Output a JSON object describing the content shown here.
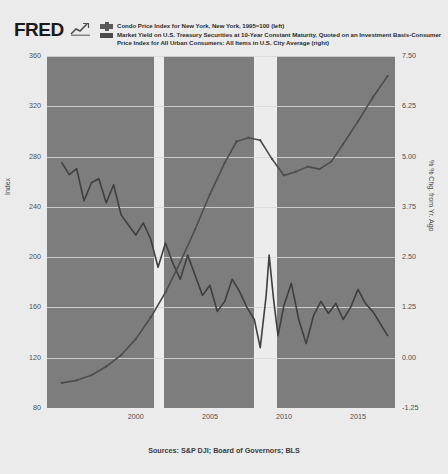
{
  "header": {
    "logo_text": "FRED",
    "logo_icon": "chart-swoosh-icon"
  },
  "legend": {
    "series": [
      {
        "marker": "cross-line-marker",
        "label": "Condo Price Index for New York, New York, 1995=100 (left)",
        "color": "#5a5a5a",
        "axis": "left"
      },
      {
        "marker": "solid-line-marker",
        "label": "Market Yield on U.S. Treasury Securities at 10-Year Constant Maturity, Quoted on an Investment Basis-Consumer Price Index for All Urban Consumers: All Items in U.S. City Average (right)",
        "color": "#4a4a4a",
        "axis": "right"
      }
    ]
  },
  "source": "Sources: S&P DJI; Board of Governors; BLS",
  "chart_data": {
    "type": "line",
    "title": "",
    "xlabel": "",
    "ylabel": "Index",
    "y2label": "% % Chg. from Yr. Ago",
    "grid": true,
    "legend_position": "top",
    "plot_background": "#7d7d7d",
    "gridline_color": "#d8d8d8",
    "page_background": "#ececec",
    "xlim": [
      1994.0,
      2017.5
    ],
    "xticks": [
      2000,
      2005,
      2010,
      2015
    ],
    "xtick_labels": [
      "2000",
      "2005",
      "2010",
      "2015"
    ],
    "ylim": [
      80,
      360
    ],
    "yticks": [
      80,
      120,
      160,
      200,
      240,
      280,
      320,
      360
    ],
    "ytick_labels": [
      "80",
      "120",
      "160",
      "200",
      "240",
      "280",
      "320",
      "360"
    ],
    "y2lim": [
      -1.25,
      7.5
    ],
    "y2ticks": [
      -1.25,
      0.0,
      1.25,
      2.5,
      3.75,
      5.0,
      6.25,
      7.5
    ],
    "y2tick_labels": [
      "-1.25",
      "0.00",
      "1.25",
      "2.50",
      "3.75",
      "5.00",
      "6.25",
      "7.50"
    ],
    "recession_bands": [
      {
        "start": 2001.2,
        "end": 2001.9
      },
      {
        "start": 2007.95,
        "end": 2009.5
      }
    ],
    "series": [
      {
        "name": "Condo Price Index for New York, New York, 1995=100 (left)",
        "axis": "left",
        "color": "#4d4d4d",
        "width": 1.6,
        "x": [
          1995.0,
          1996.0,
          1997.0,
          1998.0,
          1999.0,
          2000.0,
          2001.0,
          2002.0,
          2003.0,
          2004.0,
          2005.0,
          2006.0,
          2006.8,
          2007.6,
          2008.4,
          2009.2,
          2010.0,
          2010.8,
          2011.6,
          2012.4,
          2013.2,
          2014.0,
          2015.0,
          2016.0,
          2017.0
        ],
        "values": [
          100,
          102,
          106,
          113,
          122,
          135,
          152,
          172,
          196,
          222,
          250,
          275,
          292,
          295,
          293,
          278,
          265,
          268,
          272,
          270,
          276,
          290,
          308,
          327,
          344
        ]
      },
      {
        "name": "Market Yield on U.S. Treasury Securities at 10-Year Constant Maturity, Quoted on an Investment Basis-Consumer Price Index for All Urban Consumers: All Items in U.S. City Average (right)",
        "axis": "right",
        "color": "#3f3f3f",
        "width": 1.6,
        "x": [
          1995.0,
          1995.5,
          1996.0,
          1996.5,
          1997.0,
          1997.5,
          1998.0,
          1998.5,
          1999.0,
          1999.5,
          2000.0,
          2000.5,
          2001.0,
          2001.5,
          2002.0,
          2002.5,
          2003.0,
          2003.5,
          2004.0,
          2004.5,
          2005.0,
          2005.5,
          2006.0,
          2006.5,
          2007.0,
          2007.5,
          2008.0,
          2008.4,
          2008.8,
          2009.0,
          2009.3,
          2009.6,
          2010.0,
          2010.5,
          2011.0,
          2011.5,
          2012.0,
          2012.5,
          2013.0,
          2013.5,
          2014.0,
          2014.5,
          2015.0,
          2015.5,
          2016.0,
          2016.5,
          2017.0
        ],
        "values": [
          4.85,
          4.55,
          4.7,
          3.9,
          4.35,
          4.45,
          3.85,
          4.3,
          3.55,
          3.3,
          3.05,
          3.35,
          2.95,
          2.25,
          2.85,
          2.35,
          1.95,
          2.55,
          2.05,
          1.55,
          1.8,
          1.15,
          1.4,
          1.95,
          1.65,
          1.25,
          0.95,
          0.25,
          1.55,
          2.55,
          1.45,
          0.55,
          1.3,
          1.85,
          0.95,
          0.35,
          1.05,
          1.4,
          1.1,
          1.35,
          0.95,
          1.25,
          1.7,
          1.35,
          1.15,
          0.85,
          0.55
        ]
      }
    ]
  }
}
